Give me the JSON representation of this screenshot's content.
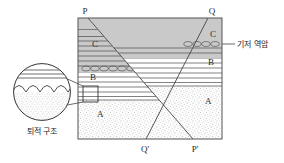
{
  "figure": {
    "background": "#ffffff",
    "ink": "#333333"
  },
  "block": {
    "x": 78,
    "y": 18,
    "width": 144,
    "height": 121,
    "border_color": "#555555",
    "fill_color": "#fbfbfb"
  },
  "corner_labels": {
    "top_left": "P",
    "top_right": "Q",
    "bottom_left": "Q'",
    "bottom_right": "P'"
  },
  "unit_labels": [
    {
      "text": "C",
      "x": 92,
      "y": 47,
      "note": "conglomerate-bearing upper unit, left block"
    },
    {
      "text": "C",
      "x": 210,
      "y": 37,
      "note": "conglomerate-bearing upper unit, right block"
    },
    {
      "text": "B",
      "x": 90,
      "y": 80,
      "note": "layered shale unit, left block"
    },
    {
      "text": "B",
      "x": 208,
      "y": 65,
      "note": "layered shale unit, right block"
    },
    {
      "text": "A",
      "x": 97,
      "y": 117,
      "note": "basement sandstone, left block"
    },
    {
      "text": "A",
      "x": 205,
      "y": 104,
      "note": "basement sandstone, right block"
    }
  ],
  "annotations": {
    "basal_conglomerate": {
      "label": "기저 역암",
      "label_x": 240,
      "label_y": 47,
      "leader_from": {
        "x": 233,
        "y": 44
      },
      "leader_to": {
        "x": 222,
        "y": 44
      }
    },
    "sedimentary_structure": {
      "label": "퇴적 구조",
      "label_x": 44,
      "label_y": 131
    }
  },
  "inset": {
    "name": "magnifier-circle",
    "cx": 42,
    "cy": 92,
    "r": 29,
    "callout_box": {
      "x": 83,
      "y": 86,
      "width": 15,
      "height": 16
    },
    "contents": {
      "horizontal_lines_count": 4,
      "scallop_arcs_count": 4,
      "stipple_below": true
    }
  },
  "faults": [
    {
      "name": "fault-P-Pprime",
      "from_label": "P",
      "to_label": "P'",
      "from": {
        "x": 88,
        "y": 18
      },
      "to": {
        "x": 193,
        "y": 139
      }
    },
    {
      "name": "fault-Q-Qprime",
      "from_label": "Q",
      "to_label": "Q'",
      "from": {
        "x": 208,
        "y": 18
      },
      "to": {
        "x": 146,
        "y": 139
      }
    }
  ],
  "strata": {
    "left_block": {
      "gray_unit_top": 18,
      "gray_unit_bottom": 72,
      "shale_top": 72,
      "shale_bottom": 100,
      "sandstone_top": 100,
      "conglomerate_band_y": 66
    },
    "right_block": {
      "gray_unit_top": 18,
      "gray_unit_bottom": 58,
      "shale_top": 58,
      "shale_bottom": 86,
      "sandstone_top": 86,
      "conglomerate_band_y": 50
    },
    "colors": {
      "gray_unit": "#c9c9c9",
      "shale_lines": "#4a4a4a",
      "sandstone_stipple": "#9a9a9a",
      "pebble_outline": "#555555"
    }
  }
}
